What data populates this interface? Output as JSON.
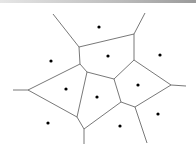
{
  "diagram": {
    "type": "voronoi",
    "edge_color": "#555555",
    "site_color": "#000000",
    "vertices": {
      "V1": [
        79,
        47
      ],
      "V2": [
        134,
        34
      ],
      "V3": [
        80,
        64
      ],
      "V4": [
        134,
        60
      ],
      "V5": [
        87,
        72
      ],
      "V6": [
        114,
        79
      ],
      "V7": [
        171,
        85
      ],
      "V8": [
        28,
        90
      ],
      "V9": [
        77,
        117
      ],
      "V10": [
        84,
        129
      ],
      "V11": [
        121,
        102
      ],
      "V12": [
        135,
        107
      ]
    },
    "edges": [
      [
        [
          53,
          14
        ],
        [
          79,
          47
        ]
      ],
      [
        [
          79,
          47
        ],
        [
          134,
          34
        ]
      ],
      [
        [
          134,
          34
        ],
        [
          145,
          13
        ]
      ],
      [
        [
          79,
          47
        ],
        [
          80,
          64
        ]
      ],
      [
        [
          134,
          34
        ],
        [
          134,
          60
        ]
      ],
      [
        [
          80,
          64
        ],
        [
          87,
          72
        ]
      ],
      [
        [
          87,
          72
        ],
        [
          114,
          79
        ]
      ],
      [
        [
          134,
          60
        ],
        [
          114,
          79
        ]
      ],
      [
        [
          134,
          60
        ],
        [
          171,
          85
        ]
      ],
      [
        [
          171,
          85
        ],
        [
          186,
          86
        ]
      ],
      [
        [
          80,
          64
        ],
        [
          28,
          90
        ]
      ],
      [
        [
          28,
          90
        ],
        [
          13,
          90
        ]
      ],
      [
        [
          28,
          90
        ],
        [
          77,
          117
        ]
      ],
      [
        [
          87,
          72
        ],
        [
          77,
          117
        ]
      ],
      [
        [
          77,
          117
        ],
        [
          84,
          129
        ]
      ],
      [
        [
          84,
          129
        ],
        [
          84,
          144
        ]
      ],
      [
        [
          114,
          79
        ],
        [
          121,
          102
        ]
      ],
      [
        [
          84,
          129
        ],
        [
          121,
          102
        ]
      ],
      [
        [
          121,
          102
        ],
        [
          135,
          107
        ]
      ],
      [
        [
          171,
          85
        ],
        [
          135,
          107
        ]
      ],
      [
        [
          135,
          107
        ],
        [
          147,
          143
        ]
      ]
    ],
    "sites": [
      [
        99,
        27
      ],
      [
        51,
        61
      ],
      [
        108,
        56
      ],
      [
        160,
        55
      ],
      [
        66,
        89
      ],
      [
        97,
        97
      ],
      [
        138,
        85
      ],
      [
        48,
        123
      ],
      [
        120,
        126
      ],
      [
        158,
        114
      ]
    ]
  }
}
